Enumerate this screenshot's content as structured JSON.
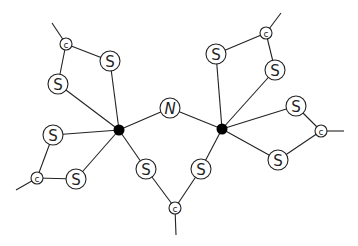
{
  "diagram": {
    "type": "molecular-structure",
    "atoms": [
      {
        "id": "M1",
        "label": "",
        "kind": "metal",
        "x": 119,
        "y": 130
      },
      {
        "id": "M2",
        "label": "",
        "kind": "metal",
        "x": 222,
        "y": 129
      },
      {
        "id": "N",
        "label": "N",
        "kind": "N",
        "x": 170,
        "y": 108
      },
      {
        "id": "S1",
        "label": "S",
        "kind": "S",
        "x": 110,
        "y": 61
      },
      {
        "id": "S2",
        "label": "S",
        "kind": "S",
        "x": 58,
        "y": 84
      },
      {
        "id": "C1",
        "label": "c",
        "kind": "C",
        "x": 66,
        "y": 44
      },
      {
        "id": "S3",
        "label": "S",
        "kind": "S",
        "x": 53,
        "y": 135
      },
      {
        "id": "S4",
        "label": "S",
        "kind": "S",
        "x": 76,
        "y": 179
      },
      {
        "id": "C2",
        "label": "c",
        "kind": "C",
        "x": 37,
        "y": 178
      },
      {
        "id": "S5",
        "label": "S",
        "kind": "S",
        "x": 146,
        "y": 169
      },
      {
        "id": "S6",
        "label": "S",
        "kind": "S",
        "x": 201,
        "y": 169
      },
      {
        "id": "C3",
        "label": "c",
        "kind": "C",
        "x": 175,
        "y": 208
      },
      {
        "id": "S7",
        "label": "S",
        "kind": "S",
        "x": 216,
        "y": 54
      },
      {
        "id": "S8",
        "label": "S",
        "kind": "S",
        "x": 275,
        "y": 70
      },
      {
        "id": "C4",
        "label": "c",
        "kind": "C",
        "x": 266,
        "y": 33
      },
      {
        "id": "S9",
        "label": "S",
        "kind": "S",
        "x": 296,
        "y": 106
      },
      {
        "id": "S10",
        "label": "S",
        "kind": "S",
        "x": 278,
        "y": 160
      },
      {
        "id": "C5",
        "label": "c",
        "kind": "C",
        "x": 321,
        "y": 131
      }
    ],
    "bonds": [
      [
        "M1",
        "N"
      ],
      [
        "N",
        "M2"
      ],
      [
        "M1",
        "S1"
      ],
      [
        "M1",
        "S2"
      ],
      [
        "M1",
        "S3"
      ],
      [
        "M1",
        "S4"
      ],
      [
        "M1",
        "S5"
      ],
      [
        "M2",
        "S6"
      ],
      [
        "M2",
        "S7"
      ],
      [
        "M2",
        "S8"
      ],
      [
        "M2",
        "S9"
      ],
      [
        "M2",
        "S10"
      ],
      [
        "S1",
        "C1"
      ],
      [
        "S2",
        "C1"
      ],
      [
        "S3",
        "C2"
      ],
      [
        "S4",
        "C2"
      ],
      [
        "S5",
        "C3"
      ],
      [
        "S6",
        "C3"
      ],
      [
        "S7",
        "C4"
      ],
      [
        "S8",
        "C4"
      ],
      [
        "S9",
        "C5"
      ],
      [
        "S10",
        "C5"
      ]
    ],
    "tails": [
      {
        "from": "C1",
        "x": 52,
        "y": 23
      },
      {
        "from": "C2",
        "x": 16,
        "y": 190
      },
      {
        "from": "C3",
        "x": 176,
        "y": 235
      },
      {
        "from": "C4",
        "x": 281,
        "y": 13
      },
      {
        "from": "C5",
        "x": 344,
        "y": 131
      }
    ],
    "radii": {
      "S": 10,
      "N": 10,
      "C": 6,
      "metal": 5.5
    }
  }
}
